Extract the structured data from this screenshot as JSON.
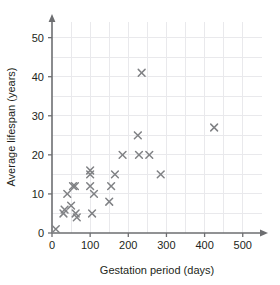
{
  "chart_data": {
    "type": "scatter",
    "title": "",
    "xlabel": "Gestation period (days)",
    "ylabel": "Average lifespan (years)",
    "xlim": [
      0,
      540
    ],
    "ylim": [
      0,
      54
    ],
    "xticks": [
      0,
      100,
      200,
      300,
      400,
      500
    ],
    "yticks": [
      0,
      10,
      20,
      30,
      40,
      50
    ],
    "xtick_labels": [
      "0",
      "100",
      "200",
      "300",
      "400",
      "500"
    ],
    "ytick_labels": [
      "0",
      "10",
      "20",
      "30",
      "40",
      "50"
    ],
    "grid": true,
    "grid_x_minor_step": 50,
    "grid_y_minor_step": 5,
    "legend": "none",
    "marker": "x",
    "marker_color": "#808285",
    "axis_color": "#6d6e71",
    "grid_color": "#e9e9ec",
    "text_color": "#231f20",
    "points": [
      {
        "x": 10,
        "y": 1
      },
      {
        "x": 30,
        "y": 5
      },
      {
        "x": 33,
        "y": 6
      },
      {
        "x": 40,
        "y": 10
      },
      {
        "x": 50,
        "y": 7
      },
      {
        "x": 55,
        "y": 12
      },
      {
        "x": 60,
        "y": 12
      },
      {
        "x": 62,
        "y": 5
      },
      {
        "x": 65,
        "y": 4
      },
      {
        "x": 100,
        "y": 16
      },
      {
        "x": 100,
        "y": 15
      },
      {
        "x": 100,
        "y": 12
      },
      {
        "x": 105,
        "y": 5
      },
      {
        "x": 110,
        "y": 10
      },
      {
        "x": 150,
        "y": 8
      },
      {
        "x": 155,
        "y": 12
      },
      {
        "x": 165,
        "y": 15
      },
      {
        "x": 185,
        "y": 20
      },
      {
        "x": 225,
        "y": 25
      },
      {
        "x": 228,
        "y": 20
      },
      {
        "x": 235,
        "y": 41
      },
      {
        "x": 255,
        "y": 20
      },
      {
        "x": 285,
        "y": 15
      },
      {
        "x": 425,
        "y": 27
      }
    ]
  }
}
